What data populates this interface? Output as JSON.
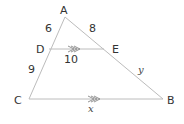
{
  "diagram": {
    "type": "triangle-with-parallel-segment",
    "points": {
      "A": {
        "label": "A",
        "x": 65,
        "y": 17
      },
      "D": {
        "label": "D",
        "x": 49,
        "y": 49
      },
      "E": {
        "label": "E",
        "x": 104,
        "y": 49
      },
      "C": {
        "label": "C",
        "x": 29,
        "y": 99
      },
      "B": {
        "label": "B",
        "x": 163,
        "y": 99
      }
    },
    "segments": {
      "AD": "6",
      "AE": "8",
      "DE": "10",
      "DC": "9",
      "EB": "y",
      "CB": "x"
    },
    "parallel": [
      "DE",
      "CB"
    ],
    "line_color": "#bcbcbc",
    "text_color": "#333333"
  }
}
